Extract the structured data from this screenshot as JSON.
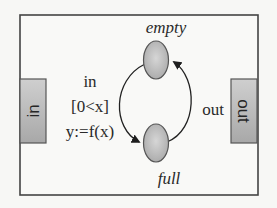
{
  "diagram": {
    "type": "state-machine-component",
    "component": {
      "border_color": "#444444",
      "background": "#f9f9f7"
    },
    "ports": [
      {
        "id": "in",
        "label": "in",
        "side": "left",
        "fill": "#b8b8b8"
      },
      {
        "id": "out",
        "label": "out",
        "side": "right",
        "fill": "#b8b8b8"
      }
    ],
    "states": [
      {
        "id": "empty",
        "label": "empty",
        "position": "top",
        "fill": "#c4c4c4"
      },
      {
        "id": "full",
        "label": "full",
        "position": "bottom",
        "fill": "#c4c4c4"
      }
    ],
    "transitions": [
      {
        "from": "empty",
        "to": "full",
        "side": "left",
        "label_lines": [
          "in",
          "[0<x]",
          "y:=f(x)"
        ]
      },
      {
        "from": "full",
        "to": "empty",
        "side": "right",
        "label_lines": [
          "out"
        ]
      }
    ]
  }
}
